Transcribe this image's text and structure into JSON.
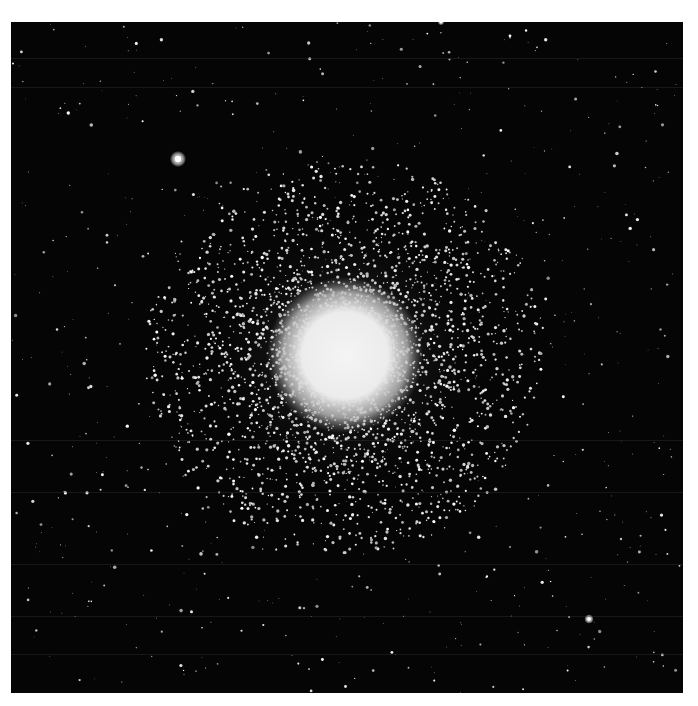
{
  "image": {
    "subject": "globular star cluster",
    "background_color": "#050505",
    "margin_color": "#ffffff",
    "frame": {
      "left": 11,
      "top": 22,
      "width": 672,
      "height": 671
    },
    "cluster": {
      "cx": 334,
      "cy": 333,
      "core_radius": 58,
      "halo_radius": 200
    },
    "bright_stars": [
      {
        "x": 167,
        "y": 137,
        "r": 4.5
      },
      {
        "x": 578,
        "y": 597,
        "r": 2.6
      },
      {
        "x": 430,
        "y": 0,
        "r": 1.8
      }
    ],
    "scanlines_y": [
      36,
      65,
      418,
      470,
      542,
      594,
      632
    ]
  }
}
